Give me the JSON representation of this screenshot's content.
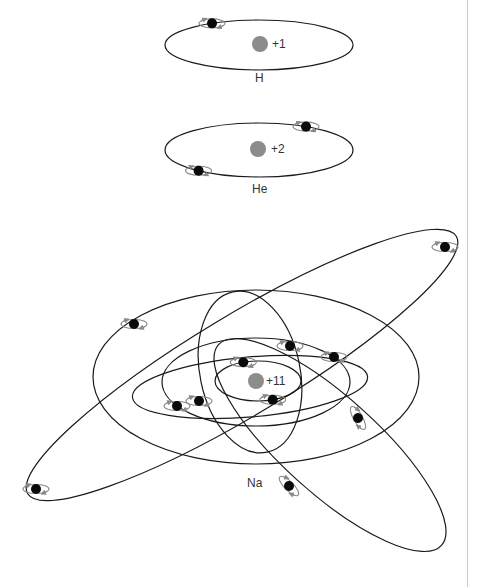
{
  "colors": {
    "orbit": "#1a1a1a",
    "electron": "#0a0a0a",
    "nucleus": "#8c8c8c",
    "spin": "#8a8a8a"
  },
  "atoms": [
    {
      "symbol": "H",
      "charge": "+1",
      "electron_count": 1,
      "orbits": [
        {
          "electron_angles_deg": [
            240
          ]
        }
      ]
    },
    {
      "symbol": "He",
      "charge": "+2",
      "electron_count": 2,
      "orbits": [
        {
          "electron_angles_deg": [
            300,
            130
          ]
        }
      ]
    },
    {
      "symbol": "Na",
      "charge": "+11",
      "electron_count": 11,
      "orbits": [
        {
          "name": "shell-1",
          "electron_angles_deg": [
            250,
            70
          ]
        },
        {
          "name": "shell-2-a",
          "electron_angles_deg": []
        },
        {
          "name": "shell-2-b",
          "electron_angles_deg": []
        },
        {
          "name": "shell-2-c",
          "electron_angles_deg": []
        },
        {
          "name": "shell-2-d",
          "electron_angles_deg": []
        },
        {
          "name": "shell-3",
          "electron_angles_deg": []
        }
      ]
    }
  ]
}
